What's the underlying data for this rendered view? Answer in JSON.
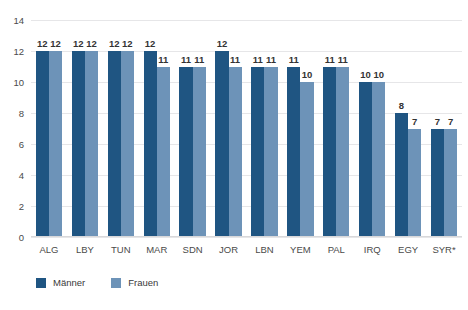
{
  "chart_data": {
    "type": "bar",
    "title": "",
    "xlabel": "",
    "ylabel": "",
    "ylim": [
      0,
      14
    ],
    "ytick_step": 2,
    "yticks": [
      "14",
      "12",
      "10",
      "8",
      "6",
      "4",
      "2",
      "0"
    ],
    "grid": "horizontal",
    "legend_position": "bottom-left",
    "categories": [
      "ALG",
      "LBY",
      "TUN",
      "MAR",
      "SDN",
      "JOR",
      "LBN",
      "YEM",
      "PAL",
      "IRQ",
      "EGY",
      "SYR*"
    ],
    "series": [
      {
        "name": "Männer",
        "color": "#1f5582",
        "values": [
          12,
          12,
          12,
          12,
          11,
          12,
          11,
          11,
          11,
          10,
          8,
          7
        ]
      },
      {
        "name": "Frauen",
        "color": "#6d93b8",
        "values": [
          12,
          12,
          12,
          11,
          11,
          11,
          11,
          10,
          11,
          10,
          7,
          7
        ]
      }
    ]
  },
  "legend": {
    "items": [
      {
        "label": "Männer",
        "color": "#1f5582"
      },
      {
        "label": "Frauen",
        "color": "#6d93b8"
      }
    ]
  },
  "colors": {
    "background": "#ffffff",
    "men": "#1f5582",
    "women": "#6d93b8",
    "gridline": "#e6e6e8",
    "axis_text": "#4a4a4a",
    "value_text": "#333333"
  }
}
